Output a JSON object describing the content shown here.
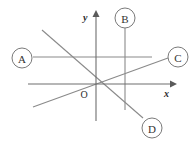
{
  "figure": {
    "background_color": "#ffffff",
    "width": 195,
    "height": 144,
    "line_color": "#8a8a8a",
    "axis_color": "#6e6e6e",
    "label_stroke_color": "#7a7a7a",
    "text_color": "#2b2b2b"
  },
  "axes": {
    "origin": {
      "label": "O",
      "x": 96,
      "y": 84
    },
    "x_axis": {
      "label": "x",
      "label_x": 166,
      "label_y": 95,
      "x1": 28,
      "y1": 84,
      "x2": 170,
      "y2": 84,
      "arrow": "right"
    },
    "y_axis": {
      "label": "y",
      "label_x": 85,
      "label_y": 18,
      "x1": 96,
      "y1": 16,
      "x2": 96,
      "y2": 121,
      "arrow": "up"
    }
  },
  "lines": [
    {
      "id": "A",
      "kind": "horizontal",
      "description": "horizontal line above the x-axis",
      "x1": 33,
      "y1": 57,
      "x2": 152,
      "y2": 57
    },
    {
      "id": "B",
      "kind": "vertical",
      "description": "vertical line right of the y-axis",
      "x1": 125,
      "y1": 28,
      "x2": 125,
      "y2": 110
    },
    {
      "id": "C",
      "kind": "increasing",
      "description": "line with positive slope through the origin",
      "x1": 33,
      "y1": 107,
      "x2": 168,
      "y2": 58
    },
    {
      "id": "D",
      "kind": "decreasing",
      "description": "line with negative slope through the origin",
      "x1": 42,
      "y1": 30,
      "x2": 143,
      "y2": 118
    }
  ],
  "labels": [
    {
      "id": "A",
      "text": "A",
      "cx": 22,
      "cy": 58,
      "r": 10
    },
    {
      "id": "B",
      "text": "B",
      "cx": 125,
      "cy": 18,
      "r": 10
    },
    {
      "id": "C",
      "text": "C",
      "cx": 178,
      "cy": 57,
      "r": 10
    },
    {
      "id": "D",
      "text": "D",
      "cx": 152,
      "cy": 128,
      "r": 10
    }
  ]
}
